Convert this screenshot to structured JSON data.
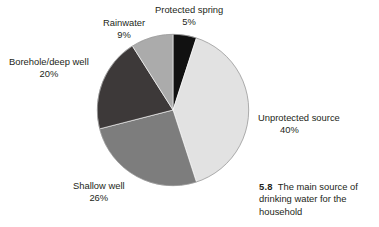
{
  "figure": {
    "caption_number": "5.8",
    "caption_text": "The main source of drinking water for the household"
  },
  "chart_data": {
    "type": "pie",
    "title": "",
    "subtitle": "",
    "xlabel": "",
    "ylabel": "",
    "legend_position": "none",
    "start_angle_deg": 0,
    "direction": "clockwise",
    "categories": [
      "Protected spring",
      "Unprotected source",
      "Shallow well",
      "Borehole/deep well",
      "Rainwater"
    ],
    "values": [
      5,
      40,
      26,
      20,
      9
    ],
    "value_labels": [
      "5%",
      "40%",
      "26%",
      "20%",
      "9%"
    ],
    "colors": [
      "#111111",
      "#e2e2e2",
      "#7d7d7d",
      "#3d3939",
      "#ababab"
    ],
    "slices": [
      {
        "name": "Protected spring",
        "value": 5,
        "label": "Protected spring",
        "pct_label": "5%",
        "color": "#111111",
        "start_deg": 0,
        "end_deg": 18
      },
      {
        "name": "Unprotected source",
        "value": 40,
        "label": "Unprotected source",
        "pct_label": "40%",
        "color": "#e2e2e2",
        "start_deg": 18,
        "end_deg": 162
      },
      {
        "name": "Shallow well",
        "value": 26,
        "label": "Shallow well",
        "pct_label": "26%",
        "color": "#7d7d7d",
        "start_deg": 162,
        "end_deg": 255.6
      },
      {
        "name": "Borehole/deep well",
        "value": 20,
        "label": "Borehole/deep well",
        "pct_label": "20%",
        "color": "#3d3939",
        "start_deg": 255.6,
        "end_deg": 327.6
      },
      {
        "name": "Rainwater",
        "value": 9,
        "label": "Rainwater",
        "pct_label": "9%",
        "color": "#ababab",
        "start_deg": 327.6,
        "end_deg": 360
      }
    ]
  }
}
